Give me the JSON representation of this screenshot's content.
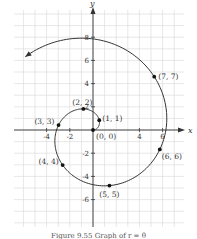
{
  "chart_data": {
    "type": "line",
    "title": "",
    "subtitle": "Polar spiral r = θ",
    "xlabel": "x",
    "ylabel": "y",
    "xlim": [
      -7,
      8
    ],
    "ylim": [
      -8,
      10
    ],
    "grid": true,
    "x_tick_labels": [
      "-4",
      "-2",
      "4",
      "6"
    ],
    "x_ticks": [
      -4,
      -2,
      4,
      6
    ],
    "y_tick_labels": [
      "8",
      "6",
      "4",
      "2",
      "-2",
      "-4",
      "-6"
    ],
    "y_ticks": [
      8,
      6,
      4,
      2,
      -2,
      -4,
      -6
    ],
    "series": [
      {
        "name": "spiral",
        "equation": "r = theta",
        "theta_range": [
          0,
          8.6
        ],
        "arrow_at_end": true,
        "color": "#333333"
      }
    ],
    "points": [
      {
        "label": "(0, 0)",
        "r": 0,
        "theta": 0
      },
      {
        "label": "(1, 1)",
        "r": 1,
        "theta": 1
      },
      {
        "label": "(2, 2)",
        "r": 2,
        "theta": 2
      },
      {
        "label": "(3, 3)",
        "r": 3,
        "theta": 3
      },
      {
        "label": "(4, 4)",
        "r": 4,
        "theta": 4
      },
      {
        "label": "(5, 5)",
        "r": 5,
        "theta": 5
      },
      {
        "label": "(6, 6)",
        "r": 6,
        "theta": 6
      },
      {
        "label": "(7, 7)",
        "r": 7,
        "theta": 7
      }
    ],
    "colors": {
      "grid": "#d6d6d6",
      "axis": "#333333",
      "curve": "#333333",
      "point": "#111111"
    }
  },
  "caption": "Figure 9.55  Graph of r = θ"
}
